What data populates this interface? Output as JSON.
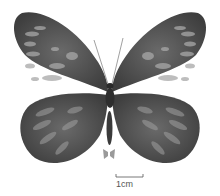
{
  "image": {
    "subject": "butterfly specimen, dorsal view",
    "background_color": "#ffffff",
    "wing_color": "#4a4a4a",
    "spot_color": "#a8a8a8",
    "body_color": "#2a2a2a"
  },
  "scale_bar": {
    "label": "1cm"
  },
  "size_icon": {
    "name": "actual-size-butterfly-icon",
    "color": "#9a9a9a"
  }
}
